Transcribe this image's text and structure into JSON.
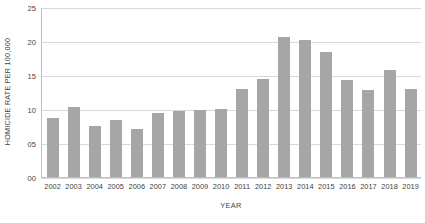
{
  "chart_data": {
    "type": "bar",
    "title": "",
    "xlabel": "YEAR",
    "ylabel": "HOMICIDE RATE PER 100,000",
    "categories": [
      "2002",
      "2003",
      "2004",
      "2005",
      "2006",
      "2007",
      "2008",
      "2009",
      "2010",
      "2011",
      "2012",
      "2013",
      "2014",
      "2015",
      "2016",
      "2017",
      "2018",
      "2019"
    ],
    "values": [
      8.8,
      10.4,
      7.5,
      8.4,
      7.1,
      9.4,
      9.7,
      9.9,
      10.0,
      13.0,
      14.5,
      20.7,
      20.3,
      18.5,
      14.3,
      12.8,
      15.9,
      13.0
    ],
    "ylim": [
      0,
      25
    ],
    "ytick_values": [
      0,
      5,
      10,
      15,
      20,
      25
    ],
    "ytick_labels": [
      "00",
      "05",
      "10",
      "15",
      "20",
      "25"
    ],
    "grid": true,
    "legend": false,
    "bar_color": "#a6a6a6",
    "gridline_color": "#d9d9d9",
    "axis_color": "#bfbfbf",
    "text_color": "#3f3f3f"
  }
}
